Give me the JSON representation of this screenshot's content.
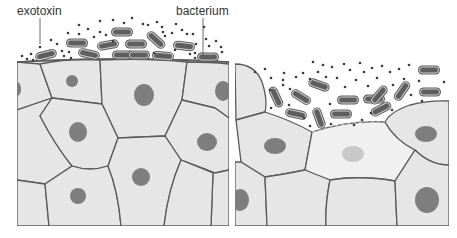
{
  "diagram": {
    "type": "biology-illustration",
    "panels": [
      {
        "id": "intact-epithelium",
        "description": "Bacteria colonizing surface of intact epithelial cell layer, releasing exotoxin"
      },
      {
        "id": "damaged-epithelium",
        "description": "Exotoxin has destroyed a surface cell; bacteria penetrate the gap"
      }
    ],
    "labels": {
      "exotoxin": "exotoxin",
      "bacterium": "bacterium"
    },
    "colors": {
      "cell_fill": "#e6e6e6",
      "cell_border": "#5a5a5a",
      "nucleus": "#7e7e7e",
      "damaged_cell_fill": "#f0f0f0",
      "damaged_nucleus": "#c8c8c8",
      "bacterium": "#5e5e5e",
      "toxin_dot": "#3a3a3a",
      "background": "#ffffff"
    }
  }
}
